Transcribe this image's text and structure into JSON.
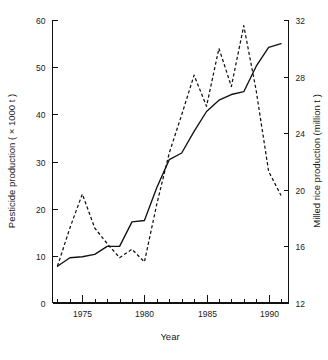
{
  "chart_data": {
    "type": "line",
    "title": "",
    "subtitle": "",
    "xlabel": "Year",
    "ylabel": "Pesticide production ( × 1000 t )",
    "y2label": "Milled rice production (million t )",
    "grid": false,
    "legend": "none",
    "xlim": [
      1972.6,
      1991.6
    ],
    "ylim": [
      0,
      60
    ],
    "y2lim": [
      12,
      32
    ],
    "x_major_ticks": [
      1975,
      1980,
      1985,
      1990
    ],
    "x_major_tick_labels": [
      "1975",
      "1980",
      "1985",
      "1990"
    ],
    "x_minor_ticks": [
      1973,
      1974,
      1976,
      1977,
      1978,
      1979,
      1981,
      1982,
      1983,
      1984,
      1986,
      1987,
      1988,
      1989,
      1991
    ],
    "y_ticks": [
      0,
      10,
      20,
      30,
      40,
      50,
      60
    ],
    "y_tick_labels": [
      "0",
      "10",
      "20",
      "30",
      "40",
      "50",
      "60"
    ],
    "y2_ticks": [
      12,
      16,
      20,
      24,
      28,
      32
    ],
    "y2_tick_labels": [
      "12",
      "16",
      "20",
      "24",
      "28",
      "32"
    ],
    "x": [
      1973,
      1974,
      1975,
      1976,
      1977,
      1978,
      1979,
      1980,
      1981,
      1982,
      1983,
      1984,
      1985,
      1986,
      1987,
      1988,
      1989,
      1990,
      1991
    ],
    "series": [
      {
        "name": "Pesticide production",
        "style": "solid",
        "axis": "left",
        "units": "× 1000 t",
        "values": [
          7.8,
          9.6,
          9.8,
          10.3,
          12.0,
          12.0,
          17.2,
          17.5,
          24.5,
          30.4,
          31.8,
          36.4,
          40.6,
          43.0,
          44.2,
          44.8,
          50.2,
          54.2,
          55.0
        ]
      },
      {
        "name": "Milled rice production",
        "style": "dashed",
        "axis": "right",
        "units": "million t",
        "values": [
          14.6,
          17.3,
          19.7,
          17.3,
          16.2,
          15.2,
          15.8,
          14.9,
          19.0,
          22.6,
          25.3,
          28.1,
          25.9,
          30.0,
          27.3,
          31.6,
          27.0,
          21.3,
          19.6
        ]
      }
    ]
  }
}
